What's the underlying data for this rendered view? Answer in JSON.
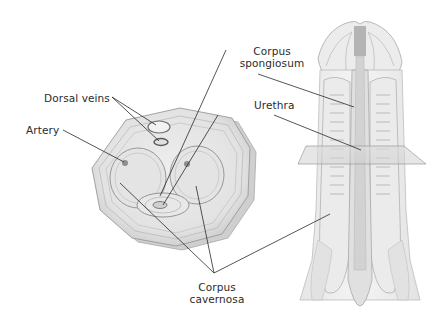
{
  "diagram": {
    "labels": {
      "dorsal_veins": "Dorsal veins",
      "artery": "Artery",
      "corpus_spongiosum_line1": "Corpus",
      "corpus_spongiosum_line2": "spongiosum",
      "urethra": "Urethra",
      "corpus_cavernosa_line1": "Corpus",
      "corpus_cavernosa_line2": "cavernosa"
    },
    "colors": {
      "leader_line": "#2a2a2a",
      "tissue_outline": "#9a9a9a",
      "tissue_fill": "#ececec",
      "tissue_shade": "#d6d6d6",
      "urethra_dark": "#a8a8a8",
      "artery_dot": "#8e8e8e",
      "vein_ring": "#6d6d6d"
    }
  }
}
